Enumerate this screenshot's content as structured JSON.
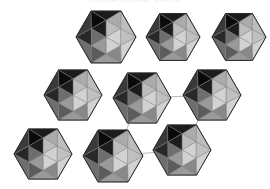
{
  "figure": {
    "background_color": "#ffffff",
    "width": 270,
    "height": 189,
    "clipped_caption_text": "ICOSAHEDRAL UNITS",
    "clipped_caption_color": "#e8e8ec"
  },
  "palette": {
    "face_highlight": "#d2d2d2",
    "face_light": "#bdbdbd",
    "face_mid": "#9a9a9a",
    "face_mid_dark": "#6e6e6e",
    "face_dark": "#3a3a3a",
    "face_darkest": "#1c1c1c",
    "face_shadow": "#2a2a2a",
    "edge_color": "#7a7a7a",
    "outline_color": "#141414",
    "bond_color": "#b0b0b0",
    "bond_width": 0.9
  },
  "shapes": {
    "type": "icosahedron",
    "radius": 30,
    "count": 8,
    "items": [
      {
        "id": "ico-r1-c1",
        "label": "top-left",
        "row": 1,
        "col": 1,
        "cx": 106,
        "cy": 37,
        "r": 30,
        "bonded": false
      },
      {
        "id": "ico-r1-c2",
        "label": "top-center",
        "row": 1,
        "col": 2,
        "cx": 173,
        "cy": 37,
        "r": 27,
        "bonded": false
      },
      {
        "id": "ico-r1-c3",
        "label": "top-right",
        "row": 1,
        "col": 3,
        "cx": 239,
        "cy": 37,
        "r": 27,
        "bonded": false
      },
      {
        "id": "ico-r2-c1",
        "label": "middle-left",
        "row": 2,
        "col": 1,
        "cx": 73,
        "cy": 95,
        "r": 29,
        "bonded": false
      },
      {
        "id": "ico-r2-c2",
        "label": "middle-center",
        "row": 2,
        "col": 2,
        "cx": 142,
        "cy": 98,
        "r": 29,
        "bonded": true
      },
      {
        "id": "ico-r2-c3",
        "label": "middle-right",
        "row": 2,
        "col": 3,
        "cx": 212,
        "cy": 95,
        "r": 29,
        "bonded": true
      },
      {
        "id": "ico-r3-c1",
        "label": "bottom-left",
        "row": 3,
        "col": 1,
        "cx": 43,
        "cy": 154,
        "r": 29,
        "bonded": false
      },
      {
        "id": "ico-r3-c2",
        "label": "bottom-center",
        "row": 3,
        "col": 2,
        "cx": 113,
        "cy": 156,
        "r": 30,
        "bonded": true
      },
      {
        "id": "ico-r3-c3",
        "label": "bottom-right",
        "row": 3,
        "col": 3,
        "cx": 182,
        "cy": 150,
        "r": 29,
        "bonded": true
      }
    ]
  },
  "bonds": {
    "count": 4,
    "items": [
      {
        "id": "bond-mc-mr",
        "from": "ico-r2-c2",
        "to": "ico-r2-c3",
        "x1": 142,
        "y1": 98,
        "x2": 212,
        "y2": 95,
        "orientation": "horizontal"
      },
      {
        "id": "bond-bc-br",
        "from": "ico-r3-c2",
        "to": "ico-r3-c3",
        "x1": 113,
        "y1": 156,
        "x2": 182,
        "y2": 150,
        "orientation": "horizontal"
      },
      {
        "id": "bond-mc-bc",
        "from": "ico-r2-c2",
        "to": "ico-r3-c2",
        "x1": 142,
        "y1": 98,
        "x2": 113,
        "y2": 156,
        "orientation": "diagonal"
      },
      {
        "id": "bond-mr-br",
        "from": "ico-r2-c3",
        "to": "ico-r3-c3",
        "x1": 212,
        "y1": 95,
        "x2": 182,
        "y2": 150,
        "orientation": "diagonal"
      }
    ]
  },
  "facets": {
    "description": "Each icosahedron is drawn as a hexagonal silhouette subdivided into twelve triangular faces with lighting from the upper-right.",
    "shading": [
      {
        "name": "upper-right-highlight",
        "tone": "face_highlight"
      },
      {
        "name": "upper-left-light",
        "tone": "face_light"
      },
      {
        "name": "center-band-mid",
        "tone": "face_mid"
      },
      {
        "name": "left-dark",
        "tone": "face_darkest"
      },
      {
        "name": "lower-left-shadow",
        "tone": "face_dark"
      },
      {
        "name": "lower-right-mid",
        "tone": "face_mid_dark"
      }
    ]
  }
}
